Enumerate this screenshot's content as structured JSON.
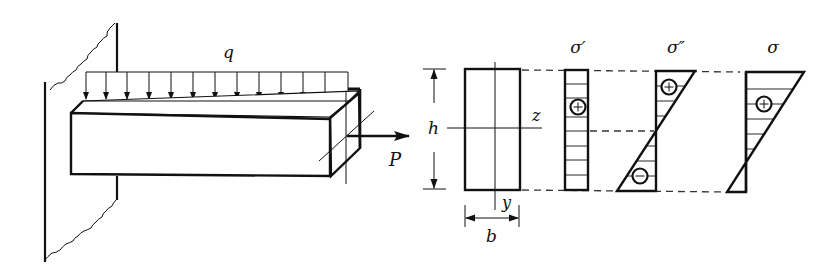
{
  "figure": {
    "colors": {
      "ink": "#111111",
      "background": "#ffffff",
      "dash": "#333333"
    }
  },
  "beam": {
    "load_label": "q",
    "axial_force_label": "P",
    "load_arrow_count": 13
  },
  "section": {
    "height_label": "h",
    "width_label": "b",
    "z_axis_label": "z",
    "y_axis_label": "y"
  },
  "stress_diagrams": [
    {
      "id": "axial",
      "label": "σ′",
      "signs": [
        "+"
      ]
    },
    {
      "id": "bending",
      "label": "σ″",
      "signs": [
        "+",
        "−"
      ]
    },
    {
      "id": "combined",
      "label": "σ",
      "signs": [
        "+"
      ]
    }
  ],
  "symbols": {
    "plus": "+",
    "minus": "−"
  }
}
